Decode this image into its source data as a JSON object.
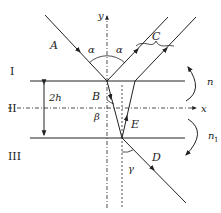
{
  "diagram": {
    "regions": [
      {
        "id": "I",
        "label": "I"
      },
      {
        "id": "II",
        "label": "II"
      },
      {
        "id": "III",
        "label": "III"
      }
    ],
    "axes": {
      "x": "x",
      "y": "y"
    },
    "rays": {
      "A": "A",
      "B": "B",
      "C": "C",
      "D": "D",
      "E": "E"
    },
    "angles": {
      "alpha": "α",
      "beta": "β",
      "gamma": "γ"
    },
    "thickness": "2h",
    "indices": {
      "n": "n",
      "n1": "n",
      "n1_sub": "1"
    }
  }
}
